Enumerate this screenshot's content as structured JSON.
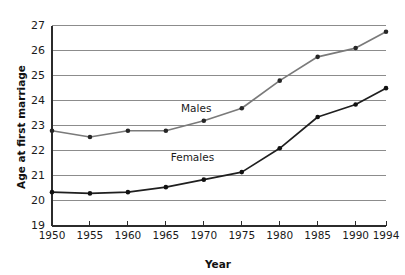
{
  "chart_data": {
    "type": "line",
    "title": "",
    "xlabel": "Year",
    "ylabel": "Age at first marriage",
    "x": [
      1950,
      1955,
      1960,
      1965,
      1970,
      1975,
      1980,
      1985,
      1990,
      1994
    ],
    "categories": [
      "1950",
      "1955",
      "1960",
      "1965",
      "1970",
      "1975",
      "1980",
      "1985",
      "1990",
      "1994"
    ],
    "xlim": [
      1950,
      1994
    ],
    "ylim": [
      19,
      27
    ],
    "yticks": [
      19,
      20,
      21,
      22,
      23,
      24,
      25,
      26,
      27
    ],
    "ytick_labels": [
      "19",
      "20",
      "21",
      "22",
      "23",
      "24",
      "25",
      "26",
      "27"
    ],
    "grid": "horizontal",
    "legend_position": "inline-labels",
    "series": [
      {
        "name": "Males",
        "color": "#7a7a7a",
        "marker_color": "#262626",
        "label_x": 1969,
        "label_y": 23.55,
        "values": [
          22.8,
          22.55,
          22.8,
          22.8,
          23.2,
          23.7,
          24.8,
          25.75,
          26.1,
          26.75
        ]
      },
      {
        "name": "Females",
        "color": "#1f1f1f",
        "marker_color": "#111111",
        "label_x": 1968.5,
        "label_y": 21.6,
        "values": [
          20.35,
          20.3,
          20.35,
          20.55,
          20.85,
          21.15,
          22.1,
          23.35,
          23.85,
          24.5
        ]
      }
    ]
  },
  "figure": {
    "background_color": "#ffffff",
    "gridline_color": "#8c8c8c",
    "axis_color": "#2b2b2b"
  }
}
